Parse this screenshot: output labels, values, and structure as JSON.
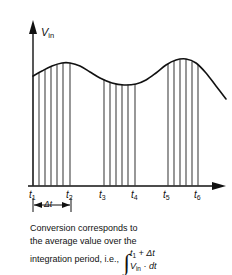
{
  "figure": {
    "y_axis_label": "V",
    "y_axis_label_sub": "in",
    "x_axis_ticks": [
      {
        "label": "t",
        "sub": "1",
        "x": 33
      },
      {
        "label": "t",
        "sub": "2",
        "x": 71
      },
      {
        "label": "t",
        "sub": "3",
        "x": 104
      },
      {
        "label": "t",
        "sub": "4",
        "x": 136
      },
      {
        "label": "t",
        "sub": "5",
        "x": 168
      },
      {
        "label": "t",
        "sub": "6",
        "x": 199
      }
    ],
    "delta_t_label": "Δt",
    "caption_line1": "Conversion corresponds to",
    "caption_line2": "the average value over the",
    "caption_line3": "integration period, i.e.,",
    "integral_symbol": "∫",
    "integral_upper": "t",
    "integral_upper_sub": "1",
    "integral_upper_rest": " + Δt",
    "integral_lower": "V",
    "integral_lower_sub": "in",
    "integral_lower_rest": " · dt",
    "line_color": "#111111",
    "hatch_color": "#3a3a3a",
    "background": "#ffffff"
  },
  "chart_data": {
    "type": "area",
    "title": "",
    "xlabel": "",
    "ylabel": "Vin",
    "axis": {
      "origin_x": 33,
      "baseline_y": 186,
      "y_top": 22,
      "x_right": 226
    },
    "curve_points": [
      [
        33,
        76
      ],
      [
        42,
        71
      ],
      [
        52,
        66
      ],
      [
        62,
        63
      ],
      [
        70,
        63
      ],
      [
        80,
        66
      ],
      [
        90,
        72
      ],
      [
        100,
        78
      ],
      [
        112,
        83
      ],
      [
        124,
        85
      ],
      [
        136,
        84
      ],
      [
        146,
        80
      ],
      [
        156,
        73
      ],
      [
        166,
        65
      ],
      [
        176,
        60
      ],
      [
        186,
        59
      ],
      [
        196,
        63
      ],
      [
        206,
        73
      ],
      [
        216,
        86
      ],
      [
        226,
        99
      ]
    ],
    "hatch_groups": [
      {
        "from_tick": "t1",
        "to_tick": "t2",
        "x_start": 33,
        "x_end": 71,
        "lines_x": [
          33,
          39,
          45,
          51,
          57,
          63,
          70
        ]
      },
      {
        "from_tick": "t3",
        "to_tick": "t4",
        "x_start": 104,
        "x_end": 136,
        "lines_x": [
          104,
          110,
          116,
          122,
          128,
          135
        ]
      },
      {
        "from_tick": "t5",
        "to_tick": "t6",
        "x_start": 168,
        "x_end": 199,
        "lines_x": [
          168,
          174,
          180,
          186,
          192,
          198
        ]
      }
    ],
    "delta_t_span": {
      "x_start": 33,
      "x_end": 71,
      "y": 205
    }
  }
}
